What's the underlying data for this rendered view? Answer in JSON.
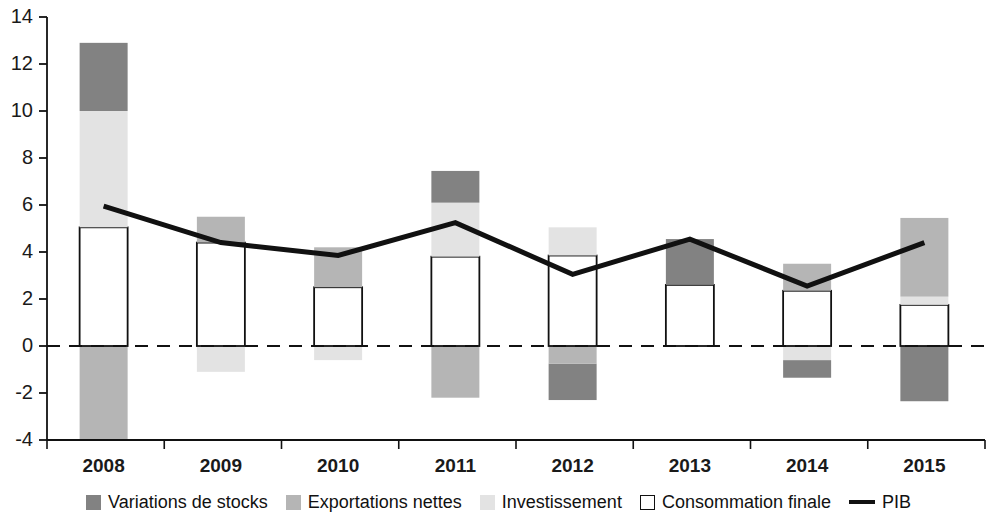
{
  "chart_data": {
    "type": "bar",
    "title": "",
    "subtitle": "",
    "xlabel": "",
    "ylabel": "",
    "categories": [
      "2008",
      "2009",
      "2010",
      "2011",
      "2012",
      "2013",
      "2014",
      "2015"
    ],
    "ylim": [
      -4,
      14
    ],
    "yticks": [
      -4,
      -2,
      0,
      2,
      4,
      6,
      8,
      10,
      12,
      14
    ],
    "ytick_labels": [
      "-4",
      "-2",
      "0",
      "2",
      "4",
      "6",
      "8",
      "10",
      "12",
      "14"
    ],
    "grid": false,
    "zero_line": 0,
    "stacked": true,
    "legend_position": "bottom",
    "series": [
      {
        "name": "Variations de stocks",
        "color": "#828282",
        "values": [
          2.9,
          0.0,
          0.0,
          1.35,
          -1.55,
          1.95,
          -0.75,
          -2.35
        ]
      },
      {
        "name": "Exportations nettes",
        "color": "#b5b5b5",
        "values": [
          -4.0,
          1.1,
          1.7,
          -2.2,
          0.0,
          0.0,
          1.15,
          3.35
        ]
      },
      {
        "name": "Investissement",
        "color": "#e3e3e3",
        "values": [
          4.95,
          -1.1,
          -0.6,
          2.3,
          1.2,
          0.0,
          -0.6,
          0.35
        ]
      },
      {
        "name": "Consommation finale",
        "color": "#ffffff",
        "values": [
          5.05,
          4.4,
          2.5,
          3.8,
          3.85,
          2.6,
          2.35,
          1.75
        ]
      }
    ],
    "line_series": {
      "name": "PIB",
      "color": "#111111",
      "values": [
        5.95,
        4.4,
        3.85,
        5.25,
        3.05,
        4.55,
        2.55,
        4.4
      ]
    },
    "segments": [
      {
        "year": "2008",
        "stack": [
          {
            "series": "Exportations nettes",
            "from": -4.0,
            "to": 0.0
          },
          {
            "series": "Consommation finale",
            "from": 0.0,
            "to": 5.05
          },
          {
            "series": "Investissement",
            "from": 5.05,
            "to": 10.0
          },
          {
            "series": "Variations de stocks",
            "from": 10.0,
            "to": 12.9
          }
        ]
      },
      {
        "year": "2009",
        "stack": [
          {
            "series": "Investissement",
            "from": -1.1,
            "to": 0.0
          },
          {
            "series": "Consommation finale",
            "from": 0.0,
            "to": 4.4
          },
          {
            "series": "Exportations nettes",
            "from": 4.4,
            "to": 5.5
          }
        ]
      },
      {
        "year": "2010",
        "stack": [
          {
            "series": "Investissement",
            "from": -0.6,
            "to": 0.0
          },
          {
            "series": "Consommation finale",
            "from": 0.0,
            "to": 2.5
          },
          {
            "series": "Exportations nettes",
            "from": 2.5,
            "to": 4.2
          }
        ]
      },
      {
        "year": "2011",
        "stack": [
          {
            "series": "Exportations nettes",
            "from": -2.2,
            "to": 0.0
          },
          {
            "series": "Consommation finale",
            "from": 0.0,
            "to": 3.8
          },
          {
            "series": "Investissement",
            "from": 3.8,
            "to": 6.1
          },
          {
            "series": "Variations de stocks",
            "from": 6.1,
            "to": 7.45
          }
        ]
      },
      {
        "year": "2012",
        "stack": [
          {
            "series": "Variations de stocks",
            "from": -2.3,
            "to": -0.75
          },
          {
            "series": "Exportations nettes",
            "from": -0.75,
            "to": 0.0
          },
          {
            "series": "Consommation finale",
            "from": 0.0,
            "to": 3.85
          },
          {
            "series": "Investissement",
            "from": 3.85,
            "to": 5.05
          }
        ]
      },
      {
        "year": "2013",
        "stack": [
          {
            "series": "Consommation finale",
            "from": 0.0,
            "to": 2.6
          },
          {
            "series": "Variations de stocks",
            "from": 2.6,
            "to": 4.55
          }
        ]
      },
      {
        "year": "2014",
        "stack": [
          {
            "series": "Variations de stocks",
            "from": -1.35,
            "to": -0.6
          },
          {
            "series": "Investissement",
            "from": -0.6,
            "to": 0.0
          },
          {
            "series": "Consommation finale",
            "from": 0.0,
            "to": 2.35
          },
          {
            "series": "Exportations nettes",
            "from": 2.35,
            "to": 3.5
          }
        ]
      },
      {
        "year": "2015",
        "stack": [
          {
            "series": "Variations de stocks",
            "from": -2.35,
            "to": 0.0
          },
          {
            "series": "Consommation finale",
            "from": 0.0,
            "to": 1.75
          },
          {
            "series": "Investissement",
            "from": 1.75,
            "to": 2.1
          },
          {
            "series": "Exportations nettes",
            "from": 2.1,
            "to": 5.45
          }
        ]
      }
    ]
  },
  "legend": {
    "items": [
      {
        "label": "Variations de stocks",
        "marker": "filled",
        "color": "#828282"
      },
      {
        "label": "Exportations nettes",
        "marker": "filled",
        "color": "#b5b5b5"
      },
      {
        "label": "Investissement",
        "marker": "filled",
        "color": "#e3e3e3"
      },
      {
        "label": "Consommation finale",
        "marker": "outlined",
        "color": "#ffffff"
      },
      {
        "label": "PIB",
        "marker": "line",
        "color": "#111111"
      }
    ]
  }
}
